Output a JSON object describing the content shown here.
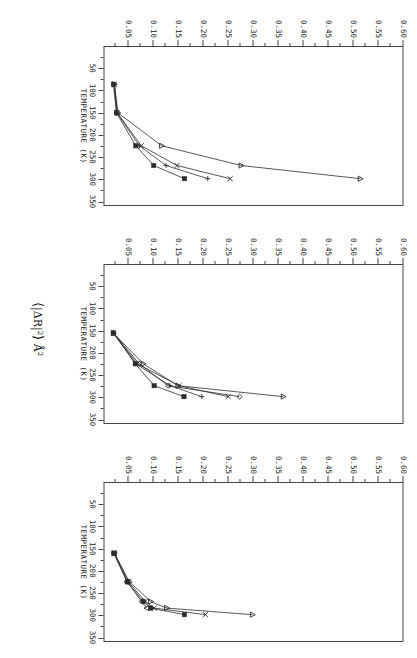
{
  "figure": {
    "y_axis_title": "⟨|ΔR|²⟩ Å²",
    "y_axis_title_parts": {
      "open": "⟨",
      "body": "|ΔR|",
      "exp1": "2",
      "close": "⟩",
      "unit": "Å",
      "exp2": "2"
    },
    "x_axis_title": "TEMPERATURE  (K)",
    "y_tick_labels": [
      "0.60",
      "0.55",
      "0.50",
      "0.45",
      "0.40",
      "0.35",
      "0.30",
      "0.25",
      "0.20",
      "0.15",
      "0.10",
      "0.05"
    ],
    "y_tick_values": [
      0.6,
      0.55,
      0.5,
      0.45,
      0.4,
      0.35,
      0.3,
      0.25,
      0.2,
      0.15,
      0.1,
      0.05
    ],
    "x_tick_labels": [
      "50",
      "100",
      "150",
      "200",
      "250",
      "300",
      "350"
    ],
    "x_tick_values": [
      50,
      100,
      150,
      200,
      250,
      300,
      350
    ],
    "orientation_note": "figure rotated 90 degrees",
    "line_color": "#2b2b2b",
    "frame_color": "#444444",
    "background_color": "#ffffff"
  },
  "chart_data": [
    {
      "type": "line",
      "panel": 1,
      "title": "",
      "xlabel": "TEMPERATURE  (K)",
      "ylabel": "⟨|ΔR|²⟩ Å²",
      "xlim": [
        0,
        360
      ],
      "ylim": [
        0,
        0.6
      ],
      "grid": false,
      "legend": "none",
      "series": [
        {
          "name": "triangle-series",
          "marker": "triangle",
          "x": [
            85,
            150,
            225,
            270,
            300
          ],
          "y": [
            0.02,
            0.027,
            0.115,
            0.275,
            0.515
          ]
        },
        {
          "name": "cross-series",
          "marker": "x",
          "x": [
            85,
            150,
            225,
            270,
            300
          ],
          "y": [
            0.02,
            0.026,
            0.074,
            0.146,
            0.253
          ]
        },
        {
          "name": "plus-series",
          "marker": "plus",
          "x": [
            85,
            150,
            225,
            270,
            300
          ],
          "y": [
            0.019,
            0.025,
            0.07,
            0.124,
            0.208
          ]
        },
        {
          "name": "filled-square-series",
          "marker": "square",
          "x": [
            85,
            150,
            225,
            270,
            300
          ],
          "y": [
            0.018,
            0.024,
            0.063,
            0.099,
            0.161
          ]
        }
      ]
    },
    {
      "type": "line",
      "panel": 2,
      "title": "",
      "xlabel": "TEMPERATURE  (K)",
      "ylabel": "⟨|ΔR|²⟩ Å²",
      "xlim": [
        0,
        360
      ],
      "ylim": [
        0,
        0.6
      ],
      "grid": false,
      "legend": "none",
      "series": [
        {
          "name": "triangle-series",
          "marker": "triangle",
          "x": [
            155,
            225,
            275,
            300
          ],
          "y": [
            0.018,
            0.078,
            0.148,
            0.36
          ]
        },
        {
          "name": "diamond-series",
          "marker": "diamond",
          "x": [
            155,
            225,
            275,
            300
          ],
          "y": [
            0.018,
            0.07,
            0.128,
            0.272
          ]
        },
        {
          "name": "cross-series",
          "marker": "x",
          "x": [
            155,
            225,
            275,
            300
          ],
          "y": [
            0.018,
            0.066,
            0.15,
            0.249
          ]
        },
        {
          "name": "plus-series",
          "marker": "plus",
          "x": [
            155,
            225,
            275,
            300
          ],
          "y": [
            0.018,
            0.063,
            0.132,
            0.196
          ]
        },
        {
          "name": "filled-square-series",
          "marker": "square",
          "x": [
            155,
            225,
            275,
            300
          ],
          "y": [
            0.018,
            0.062,
            0.1,
            0.16
          ]
        }
      ]
    },
    {
      "type": "line",
      "panel": 3,
      "title": "",
      "xlabel": "TEMPERATURE  (K)",
      "ylabel": "⟨|ΔR|²⟩ Å²",
      "xlim": [
        0,
        360
      ],
      "ylim": [
        0,
        0.6
      ],
      "grid": false,
      "legend": "none",
      "series": [
        {
          "name": "triangle-series",
          "marker": "triangle",
          "x": [
            160,
            225,
            270,
            285,
            300
          ],
          "y": [
            0.02,
            0.05,
            0.093,
            0.125,
            0.298
          ]
        },
        {
          "name": "cross-series",
          "marker": "x",
          "x": [
            160,
            225,
            270,
            285,
            300
          ],
          "y": [
            0.02,
            0.048,
            0.082,
            0.1,
            0.203
          ]
        },
        {
          "name": "filled-square-series",
          "marker": "square",
          "x": [
            160,
            225,
            270,
            285,
            300
          ],
          "y": [
            0.019,
            0.046,
            0.078,
            0.093,
            0.161
          ]
        },
        {
          "name": "open-triangle-series",
          "marker": "triangle-open",
          "x": [
            160,
            225,
            270,
            285
          ],
          "y": [
            0.019,
            0.045,
            0.075,
            0.085
          ]
        }
      ]
    }
  ]
}
